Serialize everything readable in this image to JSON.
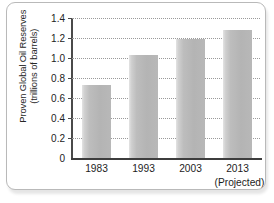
{
  "figure": {
    "frame_color": "#b9b9b9",
    "background": "#ffffff"
  },
  "chart_data": {
    "type": "bar",
    "title": "",
    "xlabel": "",
    "ylabel": "Proven Global Oil Reserves (trillions of barrels)",
    "ylabel_lines": [
      "Proven Global Oil Reserves",
      "(trillions of barrels)"
    ],
    "categories": [
      "1983",
      "1993",
      "2003",
      "2013"
    ],
    "category_sublabels": [
      "",
      "",
      "",
      "(Projected)"
    ],
    "values": [
      0.73,
      1.03,
      1.19,
      1.28
    ],
    "ylim": [
      0,
      1.4
    ],
    "ytick_labels": [
      "0",
      "0.2",
      "0.4",
      "0.6",
      "0.8",
      "1.0",
      "1.2",
      "1.4"
    ],
    "ytick_values": [
      0,
      0.2,
      0.4,
      0.6,
      0.8,
      1.0,
      1.2,
      1.4
    ],
    "grid": "horizontal-dotted",
    "legend": "none",
    "bar_color": "#bdbdbd",
    "axis_color": "#3d3d3d",
    "gridline_color": "#9a9a9a"
  }
}
